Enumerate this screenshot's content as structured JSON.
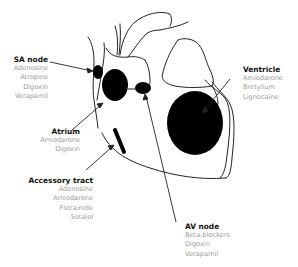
{
  "diagram": {
    "labels": {
      "sa_node": {
        "title": "SA node",
        "drugs": [
          "Adenosine",
          "Atropine",
          "Digoxin",
          "Verapamil"
        ]
      },
      "atrium": {
        "title": "Atrium",
        "drugs": [
          "Amiodarone",
          "Digoxin"
        ]
      },
      "accessory_tract": {
        "title": "Accessory tract",
        "drugs": [
          "Adenosine",
          "Amiodarone",
          "Flecainide",
          "Sotalol"
        ]
      },
      "av_node": {
        "title": "AV node",
        "drugs": [
          "Beta-blockers",
          "Digoxin",
          "Verapamil"
        ]
      },
      "ventricle": {
        "title": "Ventricle",
        "drugs": [
          "Amiodarone",
          "Bretylium",
          "Lignocaine"
        ]
      }
    },
    "colors": {
      "line": "#222222",
      "fill": "#000000",
      "title_text": "#111111",
      "drug_text": "#9a9a9a"
    }
  }
}
